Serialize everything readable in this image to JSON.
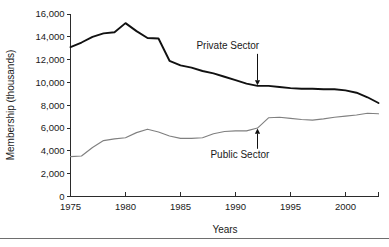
{
  "chart_data": {
    "type": "line",
    "title": "",
    "xlabel": "Years",
    "ylabel": "Membership (thousands)",
    "xlim": [
      1975,
      2003
    ],
    "ylim": [
      0,
      16000
    ],
    "grid": false,
    "legend_position": "inline-annotations",
    "x_ticks": [
      "1975",
      "1980",
      "1985",
      "1990",
      "1995",
      "2000"
    ],
    "x_tick_values": [
      1975,
      1980,
      1985,
      1990,
      1995,
      2000
    ],
    "y_ticks": [
      "0",
      "2,000",
      "4,000",
      "6,000",
      "8,000",
      "10,000",
      "12,000",
      "14,000",
      "16,000"
    ],
    "y_tick_values": [
      0,
      2000,
      4000,
      6000,
      8000,
      10000,
      12000,
      14000,
      16000
    ],
    "x": [
      1975,
      1976,
      1977,
      1978,
      1979,
      1980,
      1981,
      1982,
      1983,
      1984,
      1985,
      1986,
      1987,
      1988,
      1989,
      1990,
      1991,
      1992,
      1993,
      1994,
      1995,
      1996,
      1997,
      1998,
      1999,
      2000,
      2001,
      2002,
      2003
    ],
    "series": [
      {
        "name": "Private Sector",
        "color": "#111111",
        "values": [
          13100,
          13500,
          14000,
          14300,
          14400,
          15200,
          14500,
          13900,
          13850,
          11900,
          11500,
          11300,
          11000,
          10800,
          10500,
          10200,
          9900,
          9700,
          9700,
          9600,
          9500,
          9450,
          9450,
          9400,
          9400,
          9300,
          9100,
          8700,
          8200
        ]
      },
      {
        "name": "Public Sector",
        "color": "#808080",
        "values": [
          3500,
          3550,
          4300,
          4900,
          5050,
          5150,
          5600,
          5900,
          5650,
          5300,
          5100,
          5100,
          5150,
          5500,
          5700,
          5750,
          5750,
          6000,
          6900,
          6950,
          6850,
          6750,
          6700,
          6800,
          6950,
          7050,
          7150,
          7300,
          7250
        ]
      }
    ],
    "annotations": [
      {
        "label": "Private Sector",
        "series": "Private Sector",
        "x": 1992,
        "y": 9700,
        "label_x": 1989.3,
        "label_y": 12900
      },
      {
        "label": "Public Sector",
        "series": "Public Sector",
        "x": 1992,
        "y": 6000,
        "label_x": 1990.4,
        "label_y": 3350
      }
    ]
  }
}
